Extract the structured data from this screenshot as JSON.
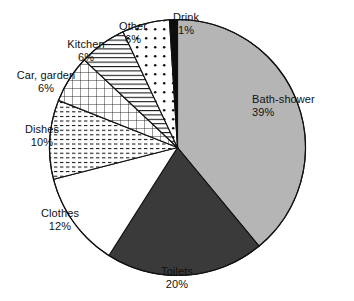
{
  "chart_data": {
    "type": "pie",
    "title": "",
    "subtitle": "",
    "xlabel": "",
    "ylabel": "",
    "legend_position": "none",
    "grid": false,
    "value_unit": "%",
    "start_angle_deg": 0,
    "direction": "clockwise",
    "categories": [
      "Bath-shower",
      "Toilets",
      "Clothes",
      "Dishes",
      "Car, garden",
      "Kitchen",
      "Other",
      "Drink"
    ],
    "values": [
      39,
      20,
      12,
      10,
      6,
      6,
      6,
      1
    ],
    "slices": [
      {
        "label": "Bath-shower",
        "value": 39,
        "value_text": "39%",
        "fill_style": "solid-light-gray",
        "color": "#b5b5b5",
        "start_deg": 0,
        "end_deg": 140.4,
        "label_align": "left"
      },
      {
        "label": "Toilets",
        "value": 20,
        "value_text": "20%",
        "fill_style": "solid-dark-gray",
        "color": "#3a3a3a",
        "start_deg": 140.4,
        "end_deg": 212.4,
        "label_align": "center"
      },
      {
        "label": "Clothes",
        "value": 12,
        "value_text": "12%",
        "fill_style": "solid-white",
        "color": "#ffffff",
        "start_deg": 212.4,
        "end_deg": 255.6,
        "label_align": "center"
      },
      {
        "label": "Dishes",
        "value": 10,
        "value_text": "10%",
        "fill_style": "dashed-horizontal-lines",
        "color": "#ffffff",
        "start_deg": 255.6,
        "end_deg": 291.6,
        "label_align": "center"
      },
      {
        "label": "Car, garden",
        "value": 6,
        "value_text": "6%",
        "fill_style": "crosshatch-grid",
        "color": "#ffffff",
        "start_deg": 291.6,
        "end_deg": 313.2,
        "label_align": "center"
      },
      {
        "label": "Kitchen",
        "value": 6,
        "value_text": "6%",
        "fill_style": "horizontal-lines",
        "color": "#ffffff",
        "start_deg": 313.2,
        "end_deg": 334.8,
        "label_align": "center"
      },
      {
        "label": "Other",
        "value": 6,
        "value_text": "6%",
        "fill_style": "dots",
        "color": "#ffffff",
        "start_deg": 334.8,
        "end_deg": 356.4,
        "label_align": "center"
      },
      {
        "label": "Drink",
        "value": 1,
        "value_text": "1%",
        "fill_style": "solid-black",
        "color": "#0d0d0d",
        "start_deg": 356.4,
        "end_deg": 360,
        "label_align": "center"
      }
    ]
  },
  "labels": {
    "bath_shower": {
      "name": "Bath-shower",
      "pct": "39%"
    },
    "toilets": {
      "name": "Toilets",
      "pct": "20%"
    },
    "clothes": {
      "name": "Clothes",
      "pct": "12%"
    },
    "dishes": {
      "name": "Dishes",
      "pct": "10%"
    },
    "car_garden": {
      "name": "Car, garden",
      "pct": "6%"
    },
    "kitchen": {
      "name": "Kitchen",
      "pct": "6%"
    },
    "other": {
      "name": "Other",
      "pct": "6%"
    },
    "drink": {
      "name": "Drink",
      "pct": "1%"
    }
  }
}
